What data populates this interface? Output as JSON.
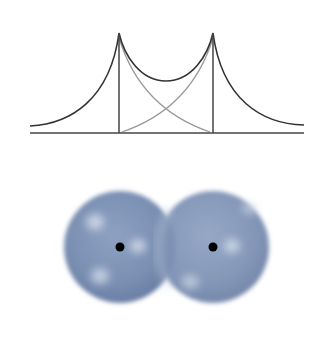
{
  "figure": {
    "type": "diagram",
    "potential_plot": {
      "baseline": {
        "x1": 30,
        "x2": 304,
        "y": 133
      },
      "nuclei": [
        {
          "x": 119,
          "peak_y": 33
        },
        {
          "x": 213,
          "peak_y": 33
        }
      ],
      "combined_curve_color": "#333333",
      "individual_curve_color": "#9a9a9a",
      "axis_color": "#444444"
    },
    "orbitals": {
      "spheres": [
        {
          "cx": 120,
          "cy": 87,
          "r": 56
        },
        {
          "cx": 213,
          "cy": 87,
          "r": 56
        }
      ],
      "sphere_color": "#7f93b5",
      "sphere_dark": "#5f7399",
      "highlight_color": "#dfe6f2",
      "nucleus_color": "#000000",
      "nucleus_radius": 4.5
    }
  }
}
